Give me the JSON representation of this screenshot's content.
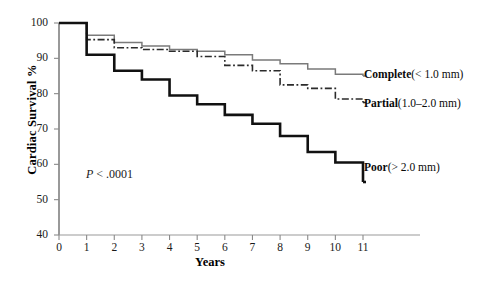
{
  "chart_data": {
    "type": "line",
    "title": "",
    "xlabel": "Years",
    "ylabel": "Cardiac Survival %",
    "xlim": [
      0,
      11
    ],
    "ylim": [
      40,
      100
    ],
    "xticks": [
      "0",
      "1",
      "2",
      "3",
      "4",
      "5",
      "6",
      "7",
      "8",
      "9",
      "10",
      "11"
    ],
    "yticks": [
      "40",
      "50",
      "60",
      "70",
      "80",
      "90",
      "100"
    ],
    "grid": false,
    "legend_position": "right-inline",
    "annotation": "P < .0001",
    "x": [
      0,
      1,
      2,
      3,
      4,
      5,
      6,
      7,
      8,
      9,
      10,
      11
    ],
    "series": [
      {
        "name": "Complete",
        "detail": "(< 1.0 mm)",
        "style": "solid",
        "color": "#7a7a7a",
        "values": [
          100,
          96.5,
          94.5,
          93.5,
          92.5,
          92.0,
          91.0,
          89.5,
          88.5,
          87.0,
          85.5,
          85.0
        ]
      },
      {
        "name": "Partial",
        "detail": "(1.0–2.0 mm)",
        "style": "dash-dot",
        "color": "#2b2b2b",
        "values": [
          100,
          95.3,
          93.0,
          92.5,
          92.0,
          90.5,
          88.0,
          86.5,
          82.5,
          81.5,
          78.5,
          77.5
        ]
      },
      {
        "name": "Poor",
        "detail": "(> 2.0 mm)",
        "style": "solid-bold",
        "color": "#111111",
        "values": [
          100,
          91.0,
          86.5,
          84.0,
          79.5,
          77.0,
          74.0,
          71.5,
          68.0,
          63.5,
          60.5,
          55.0
        ]
      }
    ]
  },
  "axes": {
    "y_title": "Cardiac Survival %",
    "x_title": "Years",
    "y_ticks": [
      {
        "label": "100"
      },
      {
        "label": "90"
      },
      {
        "label": "80"
      },
      {
        "label": "70"
      },
      {
        "label": "60"
      },
      {
        "label": "50"
      },
      {
        "label": "40"
      }
    ],
    "x_ticks": [
      {
        "label": "0"
      },
      {
        "label": "1"
      },
      {
        "label": "2"
      },
      {
        "label": "3"
      },
      {
        "label": "4"
      },
      {
        "label": "5"
      },
      {
        "label": "6"
      },
      {
        "label": "7"
      },
      {
        "label": "8"
      },
      {
        "label": "9"
      },
      {
        "label": "10"
      },
      {
        "label": "11"
      }
    ]
  },
  "annotations": {
    "p_value_symbol": "P",
    "p_value_rest": " < .0001"
  },
  "labels": {
    "complete": {
      "name": "Complete",
      "detail": "(< 1.0 mm)"
    },
    "partial": {
      "name": "Partial",
      "detail": "(1.0–2.0 mm)"
    },
    "poor": {
      "name": "Poor",
      "detail": "(> 2.0 mm)"
    }
  }
}
